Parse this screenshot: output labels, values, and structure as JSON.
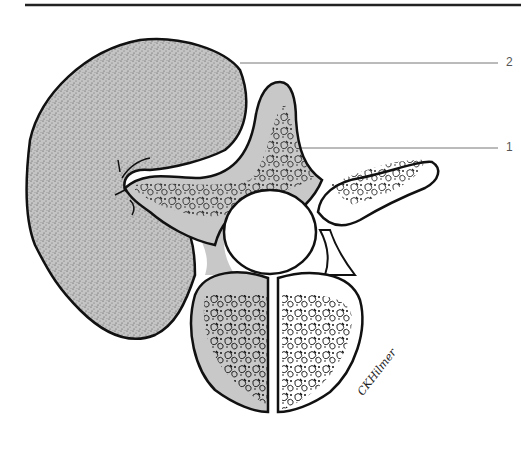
{
  "figure": {
    "type": "anatomical-illustration",
    "labels": [
      {
        "number": "2",
        "target": "stippled mass"
      },
      {
        "number": "1",
        "target": "spinous process / lamina"
      }
    ],
    "signature": "CKHilmer"
  },
  "colors": {
    "outline": "#111111",
    "bone_fill": "#c8c8c8",
    "mass_fill": "#bdbdbd",
    "background": "#ffffff",
    "leader_line": "#777777"
  }
}
